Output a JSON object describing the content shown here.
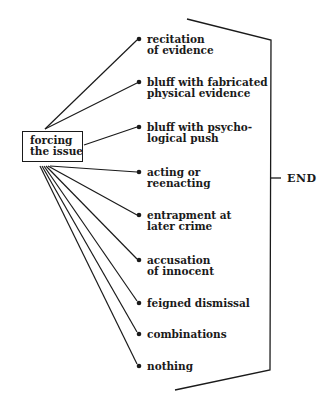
{
  "diagram": {
    "source_node": {
      "label": "forcing\nthe issue"
    },
    "options": [
      {
        "label": "recitation\nof evidence",
        "y": 39
      },
      {
        "label": "bluff with fabricated\nphysical evidence",
        "y": 82
      },
      {
        "label": "bluff with psycho-\nlogical push",
        "y": 127
      },
      {
        "label": "acting or\nreenacting",
        "y": 172
      },
      {
        "label": "entrapment at\nlater crime",
        "y": 215
      },
      {
        "label": "accusation\nof innocent",
        "y": 260
      },
      {
        "label": "feigned dismissal",
        "y": 303
      },
      {
        "label": "combinations",
        "y": 334
      },
      {
        "label": "nothing",
        "y": 366
      }
    ],
    "end_node": {
      "label": "END"
    }
  }
}
